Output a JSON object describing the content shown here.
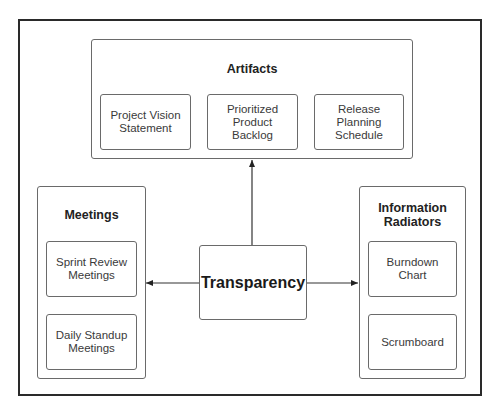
{
  "diagram": {
    "center": {
      "label": "Transparency"
    },
    "groups": [
      {
        "id": "artifacts",
        "title": "Artifacts",
        "items": [
          {
            "label": "Project Vision Statement"
          },
          {
            "label": "Prioritized Product Backlog"
          },
          {
            "label": "Release Planning Schedule"
          }
        ]
      },
      {
        "id": "meetings",
        "title": "Meetings",
        "items": [
          {
            "label": "Sprint Review Meetings"
          },
          {
            "label": "Daily Standup Meetings"
          }
        ]
      },
      {
        "id": "information-radiators",
        "title": "Information Radiators",
        "items": [
          {
            "label": "Burndown Chart"
          },
          {
            "label": "Scrumboard"
          }
        ]
      }
    ],
    "connections": [
      {
        "from": "Transparency",
        "to": "Artifacts"
      },
      {
        "from": "Transparency",
        "to": "Meetings"
      },
      {
        "from": "Transparency",
        "to": "Information Radiators"
      }
    ],
    "colors": {
      "border": "#6a6a6a",
      "outer_border": "#2a2a2a",
      "text": "#3a3a3a",
      "title": "#222222"
    }
  }
}
